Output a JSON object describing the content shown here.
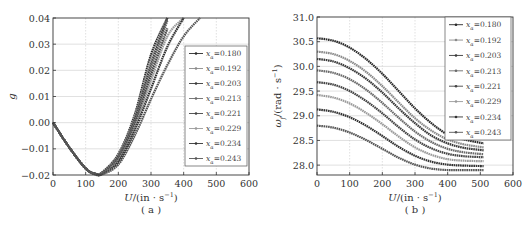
{
  "chart_data": [
    {
      "type": "line",
      "panel_label": "( a )",
      "title": "",
      "xlabel": "U/(in · s⁻¹)",
      "ylabel": "g",
      "xlim": [
        0,
        600
      ],
      "ylim": [
        -0.02,
        0.04
      ],
      "xticks": [
        "0",
        "100",
        "200",
        "300",
        "400",
        "500",
        "600"
      ],
      "yticks": [
        "-0.02",
        "-0.01",
        "0.00",
        "0.01",
        "0.02",
        "0.03",
        "0.04"
      ],
      "grid": true,
      "legend_position": "right-inside",
      "x": [
        0,
        50,
        100,
        130,
        150,
        200,
        250,
        300,
        350,
        400,
        450
      ],
      "series": [
        {
          "name": "x_α=0.180",
          "values": [
            0,
            -0.0095,
            -0.0175,
            -0.0195,
            -0.019,
            -0.012,
            0.003,
            0.026,
            0.04,
            null,
            null
          ]
        },
        {
          "name": "x_α=0.192",
          "values": [
            0,
            -0.0095,
            -0.0175,
            -0.0195,
            -0.0191,
            -0.0125,
            0.002,
            0.024,
            0.04,
            null,
            null
          ]
        },
        {
          "name": "x_α=0.203",
          "values": [
            0,
            -0.0095,
            -0.0175,
            -0.0195,
            -0.0192,
            -0.013,
            0.001,
            0.022,
            0.04,
            null,
            null
          ]
        },
        {
          "name": "x_α=0.213",
          "values": [
            0,
            -0.0095,
            -0.0175,
            -0.0196,
            -0.0193,
            -0.0135,
            0.0,
            0.02,
            0.039,
            null,
            null
          ]
        },
        {
          "name": "x_α=0.221",
          "values": [
            0,
            -0.0095,
            -0.0175,
            -0.0196,
            -0.0194,
            -0.014,
            -0.001,
            0.018,
            0.036,
            null,
            null
          ]
        },
        {
          "name": "x_α=0.229",
          "values": [
            0,
            -0.0095,
            -0.0175,
            -0.0197,
            -0.0195,
            -0.0145,
            -0.002,
            0.016,
            0.033,
            0.04,
            null
          ]
        },
        {
          "name": "x_α=0.234",
          "values": [
            0,
            -0.0095,
            -0.0175,
            -0.0197,
            -0.0196,
            -0.015,
            -0.003,
            0.013,
            0.029,
            0.04,
            null
          ]
        },
        {
          "name": "x_α=0.243",
          "values": [
            0,
            -0.0095,
            -0.0175,
            -0.0198,
            -0.0198,
            -0.016,
            -0.005,
            0.009,
            0.022,
            0.033,
            0.04
          ]
        }
      ]
    },
    {
      "type": "line",
      "panel_label": "( b )",
      "title": "",
      "xlabel": "U/(in · s⁻¹)",
      "ylabel": "ωf/(rad · s⁻¹)",
      "xlim": [
        0,
        600
      ],
      "ylim": [
        27.8,
        31.0
      ],
      "xticks": [
        "0",
        "100",
        "200",
        "300",
        "400",
        "500",
        "600"
      ],
      "yticks": [
        "28.0",
        "28.5",
        "29.0",
        "29.5",
        "30.0",
        "30.5",
        "31.0"
      ],
      "grid": true,
      "legend_position": "upper-right-inside",
      "x": [
        0,
        50,
        100,
        150,
        200,
        250,
        300,
        350,
        400,
        450,
        510
      ],
      "series": [
        {
          "name": "x_α=0.180",
          "values": [
            30.57,
            30.52,
            30.38,
            30.15,
            29.85,
            29.5,
            29.15,
            28.85,
            28.62,
            28.52,
            28.44
          ]
        },
        {
          "name": "x_α=0.192",
          "values": [
            30.3,
            30.25,
            30.11,
            29.89,
            29.6,
            29.27,
            28.95,
            28.7,
            28.52,
            28.42,
            28.36
          ]
        },
        {
          "name": "x_α=0.203",
          "values": [
            30.15,
            30.1,
            29.96,
            29.75,
            29.47,
            29.15,
            28.85,
            28.6,
            28.44,
            28.35,
            28.3
          ]
        },
        {
          "name": "x_α=0.213",
          "values": [
            29.92,
            29.87,
            29.74,
            29.53,
            29.26,
            28.96,
            28.68,
            28.47,
            28.33,
            28.26,
            28.22
          ]
        },
        {
          "name": "x_α=0.221",
          "values": [
            29.68,
            29.63,
            29.5,
            29.3,
            29.05,
            28.77,
            28.52,
            28.34,
            28.23,
            28.18,
            28.16
          ]
        },
        {
          "name": "x_α=0.229",
          "values": [
            29.42,
            29.37,
            29.25,
            29.06,
            28.83,
            28.58,
            28.36,
            28.21,
            28.12,
            28.09,
            28.08
          ]
        },
        {
          "name": "x_α=0.234",
          "values": [
            29.13,
            29.08,
            28.97,
            28.8,
            28.59,
            28.37,
            28.19,
            28.07,
            28.01,
            27.99,
            27.98
          ]
        },
        {
          "name": "x_α=0.243",
          "values": [
            28.8,
            28.76,
            28.66,
            28.51,
            28.33,
            28.15,
            28.01,
            27.93,
            27.9,
            27.9,
            27.9
          ]
        }
      ]
    }
  ],
  "panels": {
    "a": {
      "label": "( a )",
      "xlabel_var": "U",
      "xlabel_unit": "/(in · s",
      "xlabel_exp": "−1",
      "xlabel_close": ")",
      "ylabel": "g"
    },
    "b": {
      "label": "( b )",
      "xlabel_var": "U",
      "xlabel_unit": "/(in · s",
      "xlabel_exp": "−1",
      "xlabel_close": ")",
      "ylabel": "ω",
      "ylabel_sub": "f",
      "ylabel_unit": "/(rad · s",
      "ylabel_exp": "−1",
      "ylabel_close": ")"
    }
  },
  "legend": {
    "var": "x",
    "sub": "α",
    "entries": [
      "=0.180",
      "=0.192",
      "=0.203",
      "=0.213",
      "=0.221",
      "=0.229",
      "=0.234",
      "=0.243"
    ]
  },
  "colors": {
    "axis": "#333333",
    "grid": "#cccccc",
    "series": [
      "#2a2a2a",
      "#8a8a8a",
      "#3a3a3a",
      "#6a6a6a",
      "#444444",
      "#9a9a9a",
      "#333333",
      "#555555"
    ]
  }
}
